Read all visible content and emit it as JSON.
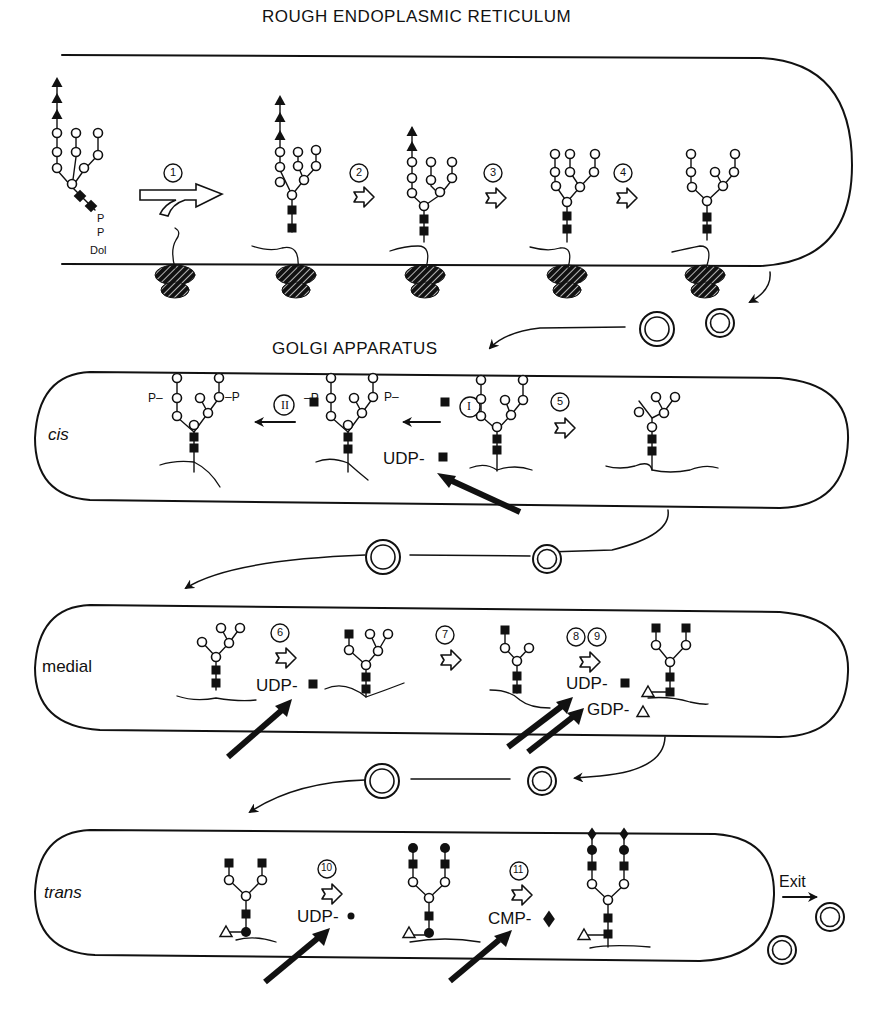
{
  "titles": {
    "er": "ROUGH ENDOPLASMIC RETICULUM",
    "golgi": "GOLGI APPARATUS"
  },
  "zones": {
    "cis": "cis",
    "medial": "medial",
    "trans": "trans"
  },
  "dolichol": {
    "p1": "P",
    "p2": "P",
    "dol": "Dol"
  },
  "steps": [
    "1",
    "2",
    "3",
    "4",
    "5",
    "6",
    "7",
    "8",
    "9",
    "10",
    "11"
  ],
  "roman_steps": [
    "I",
    "II"
  ],
  "phosphate_labels": {
    "left_p1": "P–",
    "left_p2": "–P",
    "mid_p1": "–P",
    "mid_p2": "P–",
    "p": "P"
  },
  "donors": {
    "cis_udp": "UDP-",
    "medial_udp_6": "UDP-",
    "medial_udp_8": "UDP-",
    "medial_gdp_9": "GDP-",
    "trans_udp_10": "UDP-",
    "trans_cmp_11": "CMP-"
  },
  "exit_label": "Exit",
  "legend_symbols": {
    "open_circle": "mannose",
    "filled_square": "N-acetylglucosamine",
    "filled_triangle": "glucose",
    "open_triangle": "fucose",
    "filled_circle": "galactose",
    "filled_diamond": "sialic acid"
  },
  "colors": {
    "ink": "#111111",
    "paper": "#ffffff"
  }
}
